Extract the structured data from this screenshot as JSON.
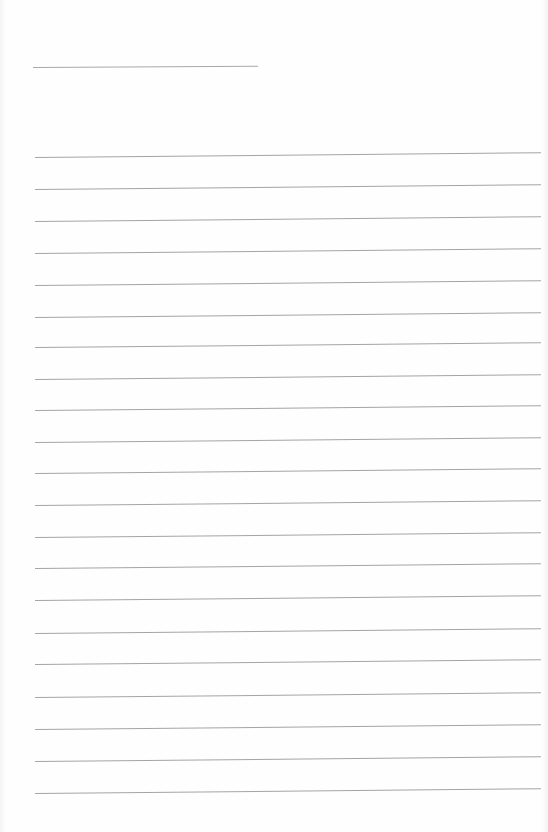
{
  "document": {
    "type": "blank ruled sheet",
    "background_color": "#fefefe",
    "line_color": "#a4a4a4",
    "header_line": {
      "x": 33,
      "y": 67,
      "width": 225
    },
    "rules": {
      "count": 21,
      "x": 35,
      "width": 506,
      "y_positions": [
        157,
        189,
        221,
        253,
        285,
        317,
        347,
        379,
        410,
        442,
        473,
        505,
        537,
        568,
        600,
        633,
        664,
        697,
        729,
        761,
        793
      ]
    }
  }
}
